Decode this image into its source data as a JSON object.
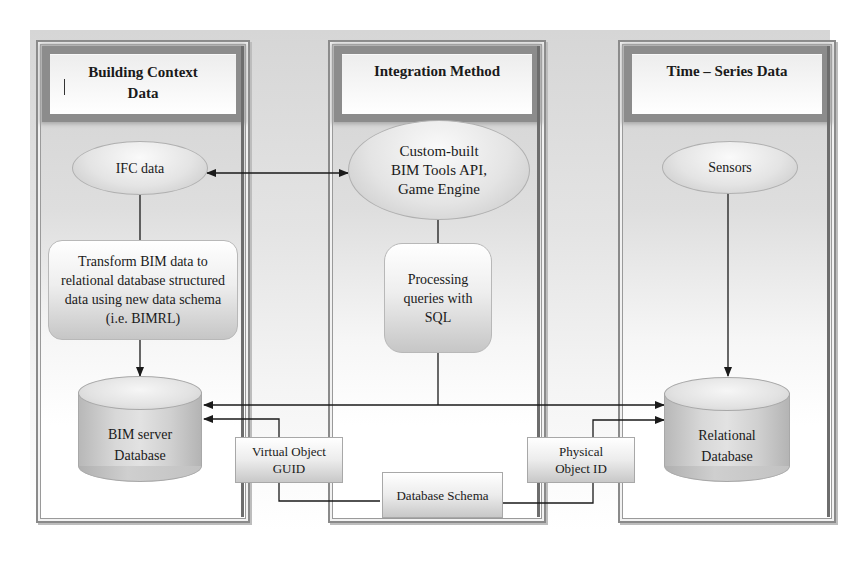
{
  "columns": [
    {
      "title_line1": "Building Context",
      "title_line2": "Data",
      "nodes": {
        "source": "IFC data",
        "process": "Transform BIM data to relational database structured data using new data schema (i.e. BIMRL)",
        "database_line1": "BIM server",
        "database_line2": "Database"
      }
    },
    {
      "title_line1": "Integration Method",
      "nodes": {
        "tools_line1": "Custom-built",
        "tools_line2": "BIM Tools API,",
        "tools_line3": "Game Engine",
        "process_line1": "Processing",
        "process_line2": "queries with",
        "process_line3": "SQL"
      }
    },
    {
      "title_line1": "Time – Series Data",
      "nodes": {
        "source": "Sensors",
        "database_line1": "Relational",
        "database_line2": "Database"
      }
    }
  ],
  "link_boxes": {
    "virtual_line1": "Virtual Object",
    "virtual_line2": "GUID",
    "physical_line1": "Physical",
    "physical_line2": "Object ID",
    "schema": "Database Schema"
  },
  "colors": {
    "line": "#1a1a1a",
    "panel_border": "#8a8a8a",
    "backdrop": "#d6d6d6"
  }
}
